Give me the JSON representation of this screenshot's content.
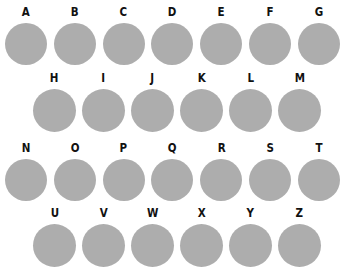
{
  "figure": {
    "title": "",
    "background_color": "#ffffff",
    "circle_color": "#adadad",
    "label_color": "#111111",
    "rows": [
      {
        "row_name": "row-1",
        "indent": "none",
        "count": 7,
        "items": [
          {
            "label": "A"
          },
          {
            "label": "B"
          },
          {
            "label": "C"
          },
          {
            "label": "D"
          },
          {
            "label": "E"
          },
          {
            "label": "F"
          },
          {
            "label": "G"
          }
        ]
      },
      {
        "row_name": "row-2",
        "indent": "offset",
        "count": 6,
        "items": [
          {
            "label": "H"
          },
          {
            "label": "I"
          },
          {
            "label": "J"
          },
          {
            "label": "K"
          },
          {
            "label": "L"
          },
          {
            "label": "M"
          }
        ]
      },
      {
        "row_name": "row-3",
        "indent": "none",
        "count": 7,
        "items": [
          {
            "label": "N"
          },
          {
            "label": "O"
          },
          {
            "label": "P"
          },
          {
            "label": "Q"
          },
          {
            "label": "R"
          },
          {
            "label": "S"
          },
          {
            "label": "T"
          }
        ]
      },
      {
        "row_name": "row-4",
        "indent": "offset",
        "count": 6,
        "items": [
          {
            "label": "U"
          },
          {
            "label": "V"
          },
          {
            "label": "W"
          },
          {
            "label": "X"
          },
          {
            "label": "Y"
          },
          {
            "label": "Z"
          }
        ]
      }
    ]
  }
}
